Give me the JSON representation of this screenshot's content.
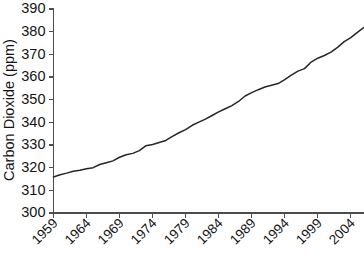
{
  "chart_data": {
    "type": "line",
    "title": "",
    "xlabel": "",
    "ylabel": "Carbon Dioxide (ppm)",
    "xlim": [
      1959,
      2006
    ],
    "ylim": [
      300,
      390
    ],
    "grid": false,
    "legend": "none",
    "y_ticks": [
      300,
      310,
      320,
      330,
      340,
      350,
      360,
      370,
      380,
      390
    ],
    "y_tick_labels": [
      "300",
      "310",
      "320",
      "330",
      "340",
      "350",
      "360",
      "370",
      "380",
      "390"
    ],
    "x_ticks": [
      1959,
      1964,
      1969,
      1974,
      1979,
      1984,
      1989,
      1994,
      1999,
      2004
    ],
    "x_tick_labels": [
      "1959",
      "1964",
      "1969",
      "1974",
      "1979",
      "1984",
      "1989",
      "1994",
      "1999",
      "2004"
    ],
    "series": [
      {
        "name": "Atmospheric CO2 annual mean",
        "color": "#262626",
        "x": [
          1959,
          1960,
          1961,
          1962,
          1963,
          1964,
          1965,
          1966,
          1967,
          1968,
          1969,
          1970,
          1971,
          1972,
          1973,
          1974,
          1975,
          1976,
          1977,
          1978,
          1979,
          1980,
          1981,
          1982,
          1983,
          1984,
          1985,
          1986,
          1987,
          1988,
          1989,
          1990,
          1991,
          1992,
          1993,
          1994,
          1995,
          1996,
          1997,
          1998,
          1999,
          2000,
          2001,
          2002,
          2003,
          2004,
          2005,
          2006
        ],
        "values": [
          315.9,
          316.9,
          317.6,
          318.4,
          318.9,
          319.5,
          320.0,
          321.4,
          322.2,
          323.0,
          324.6,
          325.7,
          326.3,
          327.5,
          329.7,
          330.2,
          331.1,
          332.0,
          333.8,
          335.4,
          336.8,
          338.7,
          340.1,
          341.4,
          343.0,
          344.6,
          346.0,
          347.4,
          349.2,
          351.6,
          353.1,
          354.4,
          355.6,
          356.4,
          357.1,
          358.8,
          360.8,
          362.6,
          363.7,
          366.6,
          368.3,
          369.5,
          371.0,
          373.1,
          375.6,
          377.4,
          379.7,
          381.9
        ]
      }
    ]
  },
  "axis": {
    "y_title": "Carbon Dioxide (ppm)"
  }
}
